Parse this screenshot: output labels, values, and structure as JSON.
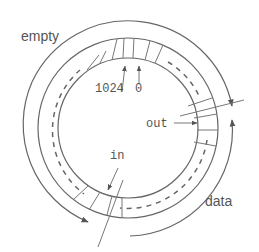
{
  "diagram": {
    "type": "circular-buffer",
    "labels": {
      "empty": "empty",
      "data": "data",
      "in": "in",
      "out": "out",
      "index_last": "1024",
      "index_first": "0"
    },
    "colors": {
      "line": "#666666",
      "text": "#555555",
      "background": "#ffffff"
    }
  }
}
